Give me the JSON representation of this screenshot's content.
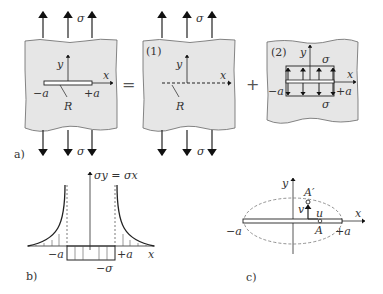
{
  "figure": {
    "panel_a": {
      "label": "a)",
      "equals": "=",
      "plus": "+",
      "plate_main": {
        "y_axis": "y",
        "x_axis": "x",
        "crack_left": "−a",
        "crack_right": "+a",
        "crack_label": "R",
        "stress_top": "σ",
        "stress_bottom": "σ"
      },
      "plate_1": {
        "tag": "(1)",
        "y_axis": "y",
        "x_axis": "x",
        "crack_label": "R",
        "stress_top": "σ",
        "stress_bottom": "σ"
      },
      "plate_2": {
        "tag": "(2)",
        "y_axis": "y",
        "x_axis": "x",
        "crack_left": "−a",
        "crack_right": "+a",
        "stress_top": "σ",
        "stress_bottom": "σ"
      }
    },
    "panel_b": {
      "label": "b)",
      "y_axis": "σy = σx",
      "x_axis": "x",
      "left": "−a",
      "right": "+a",
      "inner": "−σ"
    },
    "panel_c": {
      "label": "c)",
      "y_axis": "y",
      "x_axis": "x",
      "left": "−a",
      "right": "+a",
      "point": "A",
      "point_displaced": "A′",
      "disp_u": "u",
      "disp_v": "v"
    }
  }
}
